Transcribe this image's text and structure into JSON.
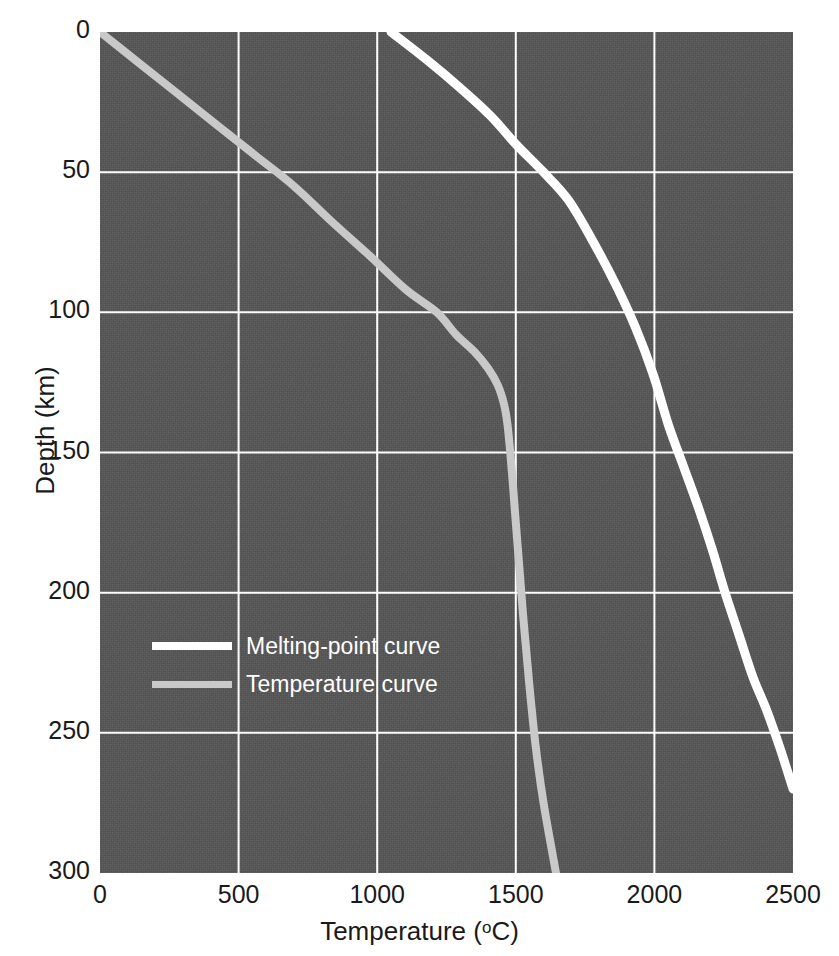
{
  "chart_data": {
    "type": "line",
    "title": "",
    "xlabel": "Temperature (°C)",
    "ylabel": "Depth (km)",
    "xlim": [
      0,
      2500
    ],
    "ylim": [
      0,
      300
    ],
    "y_axis_inverted": true,
    "grid": true,
    "legend_position": "inside-lower-left",
    "background_color": "#565656",
    "gridline_color": "#ffffff",
    "xticks": [
      0,
      500,
      1000,
      1500,
      2000,
      2500
    ],
    "yticks": [
      0,
      50,
      100,
      150,
      200,
      250,
      300
    ],
    "series": [
      {
        "name": "Melting-point curve",
        "color": "#ffffff",
        "x": [
          1050,
          1180,
          1300,
          1410,
          1500,
          1600,
          1690,
          1780,
          1860,
          1930,
          1995,
          2050,
          2105,
          2160,
          2210,
          2255,
          2305,
          2355,
          2405,
          2455,
          2500
        ],
        "y": [
          0,
          10,
          20,
          30,
          40,
          50,
          60,
          75,
          90,
          105,
          122,
          140,
          155,
          170,
          185,
          200,
          215,
          230,
          242,
          256,
          270
        ]
      },
      {
        "name": "Temperature curve",
        "color": "#c9c9c9",
        "x": [
          0,
          140,
          280,
          420,
          560,
          700,
          840,
          975,
          1105,
          1215,
          1285,
          1350,
          1400,
          1435,
          1458,
          1470,
          1480,
          1490,
          1500,
          1512,
          1528,
          1548,
          1572,
          1600,
          1645
        ],
        "y": [
          0,
          11,
          22,
          33,
          44,
          55,
          68,
          80,
          92,
          100,
          108,
          114,
          120,
          126,
          133,
          140,
          150,
          162,
          175,
          190,
          210,
          232,
          255,
          275,
          300
        ]
      }
    ]
  },
  "axes": {
    "x_title_main": "Temperature (",
    "x_title_degree": "o",
    "x_title_tail": "C)",
    "x_title_full": "Temperature (°C)",
    "y_title": "Depth (km)",
    "x_tick_labels": [
      "0",
      "500",
      "1000",
      "1500",
      "2000",
      "2500"
    ],
    "y_tick_labels": [
      "0",
      "50",
      "100",
      "150",
      "200",
      "250",
      "300"
    ]
  },
  "legend": {
    "items": [
      {
        "label": "Melting-point curve",
        "color": "#ffffff"
      },
      {
        "label": "Temperature curve",
        "color": "#c9c9c9"
      }
    ]
  }
}
